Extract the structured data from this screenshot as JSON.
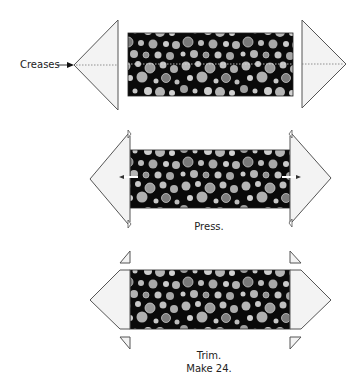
{
  "diagram": {
    "type": "quilting-step-illustration",
    "colors": {
      "outline": "#555555",
      "triangle_fill": "#f3f3f3",
      "fabric_background": "#0a0a0a",
      "dot_light": "#c4c4c4",
      "dot_mid": "#a0a0a0",
      "dot_dark": "#7a7a7a"
    },
    "steps": [
      {
        "id": "step-1",
        "label": "Creases",
        "description": "Fabric rectangle with two triangles, center creases marked"
      },
      {
        "id": "step-2",
        "caption": "Press.",
        "description": "Triangles sewn to rectangle ends and pressed outward"
      },
      {
        "id": "step-3",
        "caption_line1": "Trim.",
        "caption_line2": "Make 24.",
        "description": "Excess dog-ear triangles trimmed off"
      }
    ]
  }
}
